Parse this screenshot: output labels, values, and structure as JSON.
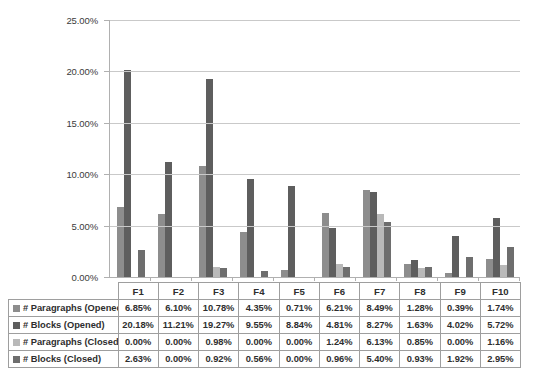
{
  "chart_data": {
    "type": "bar",
    "title": "",
    "xlabel": "",
    "ylabel": "",
    "ylim": [
      0,
      25
    ],
    "grid": true,
    "legend_position": "table-below",
    "y_ticks": [
      "0.00%",
      "5.00%",
      "10.00%",
      "15.00%",
      "20.00%",
      "25.00%"
    ],
    "y_tick_values": [
      0,
      5,
      10,
      15,
      20,
      25
    ],
    "categories": [
      "F1",
      "F2",
      "F3",
      "F4",
      "F5",
      "F6",
      "F7",
      "F8",
      "F9",
      "F10"
    ],
    "series": [
      {
        "name": "# Paragraphs (Opened)",
        "color": "#8d8d8d",
        "values": [
          6.85,
          6.1,
          10.78,
          4.35,
          0.71,
          6.21,
          8.49,
          1.28,
          0.39,
          1.74
        ],
        "labels": [
          "6.85%",
          "6.10%",
          "10.78%",
          "4.35%",
          "0.71%",
          "6.21%",
          "8.49%",
          "1.28%",
          "0.39%",
          "1.74%"
        ]
      },
      {
        "name": "# Blocks (Opened)",
        "color": "#5e5e5e",
        "values": [
          20.18,
          11.21,
          19.27,
          9.55,
          8.84,
          4.81,
          8.27,
          1.63,
          4.02,
          5.72
        ],
        "labels": [
          "20.18%",
          "11.21%",
          "19.27%",
          "9.55%",
          "8.84%",
          "4.81%",
          "8.27%",
          "1.63%",
          "4.02%",
          "5.72%"
        ]
      },
      {
        "name": "# Paragraphs (Closed)",
        "color": "#b9b9b9",
        "values": [
          0.0,
          0.0,
          0.98,
          0.0,
          0.0,
          1.24,
          6.13,
          0.85,
          0.0,
          1.16
        ],
        "labels": [
          "0.00%",
          "0.00%",
          "0.98%",
          "0.00%",
          "0.00%",
          "1.24%",
          "6.13%",
          "0.85%",
          "0.00%",
          "1.16%"
        ]
      },
      {
        "name": "# Blocks (Closed)",
        "color": "#6e6e6e",
        "values": [
          2.63,
          0.0,
          0.92,
          0.56,
          0.0,
          0.96,
          5.4,
          0.93,
          1.92,
          2.95
        ],
        "labels": [
          "2.63%",
          "0.00%",
          "0.92%",
          "0.56%",
          "0.00%",
          "0.96%",
          "5.40%",
          "0.93%",
          "1.92%",
          "2.95%"
        ]
      }
    ]
  },
  "colors": {
    "series_1": "#8d8d8d",
    "series_2": "#5e5e5e",
    "series_3": "#b9b9b9",
    "series_4": "#6e6e6e",
    "gridline": "#c9c9c9",
    "axis": "#b0b0b0",
    "table_border": "#9e9e9e",
    "text": "#3b3b3b",
    "background": "#ffffff"
  }
}
